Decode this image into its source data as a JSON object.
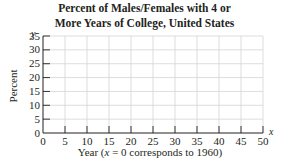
{
  "chart_data": {
    "type": "line",
    "title": "Percent of Males/Females with 4 or More Years of College, United States",
    "title_lines": [
      "Percent of Males/Females with 4 or",
      "More Years of College, United States"
    ],
    "xlabel": "Year (x = 0 corresponds to 1960)",
    "ylabel": "Percent",
    "x_axis_var": "x",
    "y_axis_var": "y",
    "xlim": [
      0,
      50
    ],
    "ylim": [
      0,
      35
    ],
    "x_ticks": [
      0,
      5,
      10,
      15,
      20,
      25,
      30,
      35,
      40,
      45,
      50
    ],
    "y_ticks": [
      0,
      5,
      10,
      15,
      20,
      25,
      30,
      35
    ],
    "grid": true,
    "series": []
  },
  "labels": {
    "title_line1": "Percent of Males/Females with 4 or",
    "title_line2": "More Years of College, United States",
    "xlabel_prefix": "Year (",
    "xlabel_var": "x",
    "xlabel_suffix": " = 0 corresponds to 1960)",
    "ylabel": "Percent",
    "x_var": "x",
    "y_var": "y"
  }
}
